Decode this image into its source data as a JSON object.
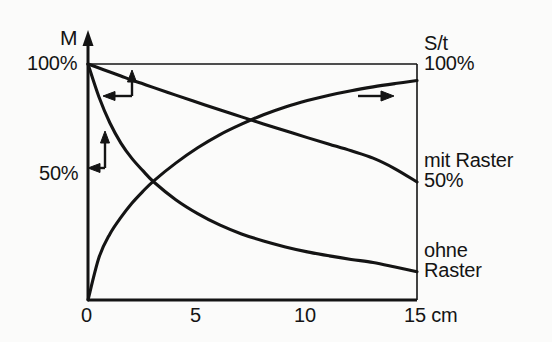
{
  "figure": {
    "background_color": "#fbfbfa",
    "ink_color": "#141414"
  },
  "axes": {
    "y_axis_title": "M",
    "y_tick_top": "100%",
    "y_tick_mid": "50%",
    "x_ticks": [
      "0",
      "5",
      "10",
      "15 cm"
    ],
    "x_unit": "cm"
  },
  "right_labels": {
    "st_title": "S/t",
    "st_value": "100%",
    "mit_raster": "mit Raster",
    "mit_raster_value": "50%",
    "ohne_raster_line1": "ohne",
    "ohne_raster_line2": "Raster"
  },
  "annotations": [
    {
      "name": "arrow-up-left-top",
      "direction": "up-left"
    },
    {
      "name": "arrow-up-left-mid",
      "direction": "up-left"
    },
    {
      "name": "arrow-right",
      "direction": "right"
    }
  ],
  "chart_data": {
    "type": "line",
    "title": "",
    "subtitle": "",
    "xlabel": "cm",
    "ylabel": "M",
    "xlim": [
      0,
      15
    ],
    "ylim": [
      0,
      100
    ],
    "grid": false,
    "legend_position": "right-inline",
    "x_ticks": [
      0,
      5,
      10,
      15
    ],
    "x_tick_labels": [
      "0",
      "5",
      "10",
      "15 cm"
    ],
    "y_ticks": [
      50,
      100
    ],
    "y_tick_labels": [
      "50%",
      "100%"
    ],
    "secondary_axis": {
      "label": "S/t",
      "top_value": "100%"
    },
    "x": [
      0,
      0.5,
      1,
      1.5,
      2,
      2.5,
      3,
      4,
      5,
      6,
      7,
      8,
      9,
      10,
      11,
      12,
      13,
      14,
      15
    ],
    "series": [
      {
        "name": "mit Raster",
        "axis": "left",
        "end_label": "mit Raster",
        "end_value_label": "50%",
        "values": [
          100,
          98.3,
          96.6,
          94.9,
          93.2,
          91.6,
          90.0,
          86.8,
          83.7,
          80.6,
          77.6,
          74.6,
          71.7,
          68.8,
          66.0,
          63.2,
          60.1,
          55.6,
          50
        ]
      },
      {
        "name": "ohne Raster",
        "axis": "left",
        "end_label": "ohne Raster",
        "end_value_label": "",
        "values": [
          100,
          86.0,
          75.0,
          66.5,
          60.0,
          54.8,
          50.0,
          42.5,
          36.6,
          31.8,
          28.0,
          25.0,
          22.5,
          20.4,
          18.7,
          17.2,
          15.9,
          14.0,
          12.0
        ]
      },
      {
        "name": "S/t",
        "axis": "right",
        "end_label": "S/t",
        "end_value_label": "100%",
        "values": [
          0,
          18.0,
          28.0,
          35.0,
          41.0,
          46.0,
          50.5,
          58.0,
          64.5,
          70.0,
          74.5,
          78.5,
          81.8,
          84.5,
          86.8,
          88.7,
          90.3,
          91.7,
          93.0
        ]
      }
    ],
    "intersections": [
      {
        "series": [
          "ohne Raster",
          "S/t"
        ],
        "x": 3.0,
        "y": 50
      },
      {
        "series": [
          "mit Raster",
          "S/t"
        ],
        "x": 7.3,
        "y": 78
      }
    ]
  }
}
